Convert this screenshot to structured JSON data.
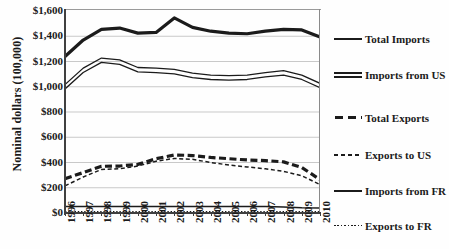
{
  "chart_data": {
    "type": "line",
    "title": "",
    "xlabel": "",
    "ylabel": "Nominal dollars (100,000)",
    "x": [
      1996,
      1997,
      1998,
      1999,
      2000,
      2001,
      2002,
      2003,
      2004,
      2005,
      2006,
      2007,
      2008,
      2009,
      2010
    ],
    "categories": [
      "1996",
      "1997",
      "1998",
      "1999",
      "2000",
      "2001",
      "2002",
      "2003",
      "2004",
      "2005",
      "2006",
      "2007",
      "2008",
      "2009",
      "2010"
    ],
    "xlim": [
      1996,
      2010
    ],
    "ylim": [
      0,
      1600
    ],
    "ytick_labels": [
      "$0",
      "$200",
      "$400",
      "$600",
      "$800",
      "$1,000",
      "$1,200",
      "$1,400",
      "$1,600"
    ],
    "ytick_values": [
      0,
      200,
      400,
      600,
      800,
      1000,
      1200,
      1400,
      1600
    ],
    "grid": true,
    "legend_position": "right",
    "series": [
      {
        "name": "Total Imports",
        "style": "solid-thick",
        "values": [
          1240,
          1370,
          1455,
          1465,
          1425,
          1430,
          1545,
          1470,
          1440,
          1425,
          1420,
          1440,
          1455,
          1450,
          1395
        ]
      },
      {
        "name": "Imports from US",
        "style": "solid-double",
        "values": [
          1000,
          1130,
          1210,
          1195,
          1135,
          1130,
          1120,
          1090,
          1075,
          1070,
          1075,
          1095,
          1110,
          1075,
          1010
        ]
      },
      {
        "name": "Total Exports",
        "style": "dashed-thick",
        "values": [
          272,
          320,
          370,
          372,
          385,
          430,
          460,
          455,
          440,
          430,
          420,
          415,
          405,
          360,
          265
        ]
      },
      {
        "name": "Exports to US",
        "style": "dashed-thin",
        "values": [
          215,
          285,
          345,
          350,
          372,
          410,
          432,
          425,
          400,
          380,
          365,
          350,
          330,
          295,
          225
        ]
      },
      {
        "name": "Imports from FR",
        "style": "solid-thin",
        "values": [
          52,
          52,
          52,
          52,
          52,
          52,
          52,
          52,
          52,
          52,
          52,
          52,
          48,
          42,
          40
        ]
      },
      {
        "name": "Exports to FR",
        "style": "dotted",
        "values": [
          10,
          10,
          10,
          10,
          10,
          10,
          10,
          10,
          10,
          10,
          10,
          10,
          10,
          10,
          10
        ]
      }
    ],
    "colors": {
      "line": "#1b1b1b",
      "grid": "#c9c9c9",
      "axis": "#404040",
      "background": "#fefefe"
    }
  },
  "legend": {
    "items": [
      {
        "label": "Total Imports"
      },
      {
        "label": "Imports from US"
      },
      {
        "label": "Total Exports"
      },
      {
        "label": "Exports to US"
      },
      {
        "label": "Imports from FR"
      },
      {
        "label": "Exports to FR"
      }
    ]
  }
}
